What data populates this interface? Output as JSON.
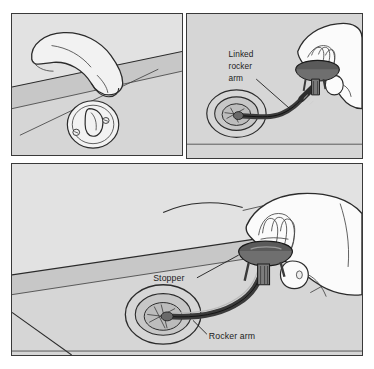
{
  "figure": {
    "background_color": "#ffffff",
    "panel_fill": "#d6d6d6",
    "panel_border_color": "#3a3a3a",
    "ink_color": "#1c1c1c"
  },
  "panels": [
    {
      "id": "panel-spout",
      "name": "tub-spout-overflow-panel",
      "description": "Tub spout above an overflow plate with trip lever on the tub wall"
    },
    {
      "id": "panel-inset",
      "name": "linked-rocker-arm-inset-panel",
      "description": "Hand lifting stopper out of the drain showing the linked rocker arm"
    },
    {
      "id": "panel-main",
      "name": "stopper-removal-panel",
      "description": "Hand pulling the stopper and rocker arm from the tub drain"
    }
  ],
  "labels": {
    "inset": {
      "linked_rocker_arm": {
        "line1": "Linked",
        "line2": "rocker",
        "line3": "arm"
      }
    },
    "main": {
      "stopper": "Stopper",
      "rocker_arm": "Rocker arm"
    }
  },
  "colors": {
    "panel_fill": "#d6d6d6",
    "surface_light": "#e2e2e2",
    "surface_dark": "#c7c7c7",
    "stopper_dark": "#5a5a5a",
    "stopper_mid": "#6f6f6f",
    "rocker_arm": "#4a4a4a",
    "hand": "#fbfbfb",
    "outline": "#2b2b2b"
  }
}
